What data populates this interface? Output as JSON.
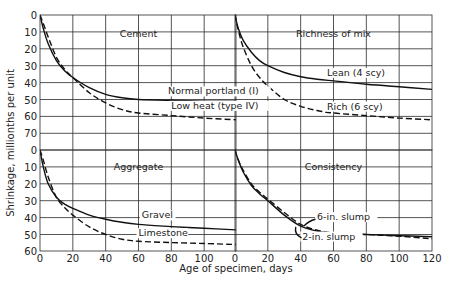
{
  "chart_data": {
    "type": "line",
    "title": "",
    "xlabel": "Age of specimen, days",
    "ylabel": "Shrinkage, millionths per unit",
    "grid": true,
    "layout": "2x2 panels sharing axes",
    "panels": [
      {
        "id": "cement",
        "title": "Cement",
        "position": "top-left",
        "xlim": [
          0,
          120
        ],
        "ylim": [
          0,
          80
        ],
        "y_inverted": true,
        "yticks": [
          0,
          10,
          20,
          30,
          40,
          50,
          60,
          70
        ],
        "series": [
          {
            "name": "Normal portland (I)",
            "style": "solid",
            "x": [
              0,
              2,
              5,
              10,
              15,
              20,
              30,
              40,
              50,
              60,
              80,
              100,
              120
            ],
            "y": [
              0,
              8,
              17,
              27,
              33,
              37,
              43,
              47,
              49,
              50,
              50.5,
              51,
              51
            ]
          },
          {
            "name": "Low heat (type IV)",
            "style": "dashed",
            "x": [
              0,
              2,
              5,
              10,
              15,
              20,
              30,
              40,
              50,
              60,
              80,
              100,
              120
            ],
            "y": [
              0,
              5,
              13,
              25,
              32,
              37,
              46,
              52,
              56,
              58,
              59.5,
              61,
              62
            ]
          }
        ],
        "labels": [
          {
            "text": "Normal portland (I)",
            "x": 78,
            "y": 47
          },
          {
            "text": "Low heat (type IV)",
            "x": 80,
            "y": 55.5
          }
        ]
      },
      {
        "id": "richness",
        "title": "Richness of mix",
        "position": "top-right",
        "xlim": [
          0,
          120
        ],
        "ylim": [
          0,
          80
        ],
        "y_inverted": true,
        "series": [
          {
            "name": "Lean (4 scy)",
            "style": "solid",
            "x": [
              0,
              2,
              5,
              10,
              15,
              20,
              30,
              40,
              50,
              60,
              80,
              100,
              120
            ],
            "y": [
              0,
              8,
              15,
              22,
              27,
              30,
              34,
              36.5,
              38,
              39,
              41,
              42.5,
              44
            ]
          },
          {
            "name": "Rich (6 scy)",
            "style": "dashed",
            "x": [
              0,
              2,
              5,
              10,
              15,
              20,
              30,
              40,
              50,
              60,
              80,
              100,
              120
            ],
            "y": [
              0,
              9,
              19,
              30,
              37,
              42,
              50,
              54,
              56.5,
              58,
              59.5,
              61,
              62
            ]
          }
        ],
        "labels": [
          {
            "text": "Lean (4 scy)",
            "x": 56,
            "y": 36
          },
          {
            "text": "Rich (6 scy)",
            "x": 56,
            "y": 56
          }
        ]
      },
      {
        "id": "aggregate",
        "title": "Aggregate",
        "position": "bottom-left",
        "xlim": [
          0,
          120
        ],
        "ylim": [
          0,
          60
        ],
        "y_inverted": true,
        "yticks": [
          0,
          10,
          20,
          30,
          40,
          50,
          60
        ],
        "xticks": [
          0,
          20,
          40,
          60,
          80,
          100
        ],
        "series": [
          {
            "name": "Gravel",
            "style": "solid",
            "x": [
              0,
              2,
              5,
              10,
              15,
              20,
              30,
              40,
              50,
              60,
              80,
              100,
              120
            ],
            "y": [
              0,
              10,
              20,
              28,
              32,
              34.5,
              38.5,
              41,
              42.8,
              44,
              45.3,
              46.3,
              47.3
            ]
          },
          {
            "name": "Limestone",
            "style": "dashed",
            "x": [
              0,
              2,
              5,
              10,
              15,
              20,
              30,
              40,
              50,
              60,
              80,
              100,
              120
            ],
            "y": [
              0,
              6,
              16,
              28,
              34,
              38.5,
              45.5,
              50,
              52.8,
              54,
              54.8,
              55.3,
              56
            ]
          }
        ],
        "labels": [
          {
            "text": "Gravel",
            "x": 62,
            "y": 40.5
          },
          {
            "text": "Limestone",
            "x": 60,
            "y": 51
          }
        ]
      },
      {
        "id": "consistency",
        "title": "Consistency",
        "position": "bottom-right",
        "xlim": [
          0,
          120
        ],
        "ylim": [
          0,
          60
        ],
        "y_inverted": true,
        "xticks": [
          0,
          20,
          40,
          60,
          80,
          100,
          120
        ],
        "series": [
          {
            "name": "6-in. slump",
            "style": "dashed",
            "x": [
              0,
              2,
              5,
              10,
              15,
              20,
              30,
              40,
              50,
              60,
              80,
              100,
              120
            ],
            "y": [
              0,
              6,
              12,
              20,
              25,
              29,
              37,
              44,
              47.5,
              49,
              50,
              51,
              52.5
            ]
          },
          {
            "name": "2-in. slump",
            "style": "solid",
            "x": [
              0,
              2,
              5,
              10,
              15,
              20,
              30,
              40,
              50,
              60,
              80,
              100,
              120
            ],
            "y": [
              0,
              6,
              13,
              21,
              26,
              30,
              38.5,
              45,
              48,
              49.3,
              50,
              50.7,
              51.3
            ]
          }
        ],
        "labels": [
          {
            "text": "6-in. slump",
            "x": 50,
            "y": 41.5
          },
          {
            "text": "2-in. slump",
            "x": 41,
            "y": 53
          }
        ]
      }
    ]
  }
}
